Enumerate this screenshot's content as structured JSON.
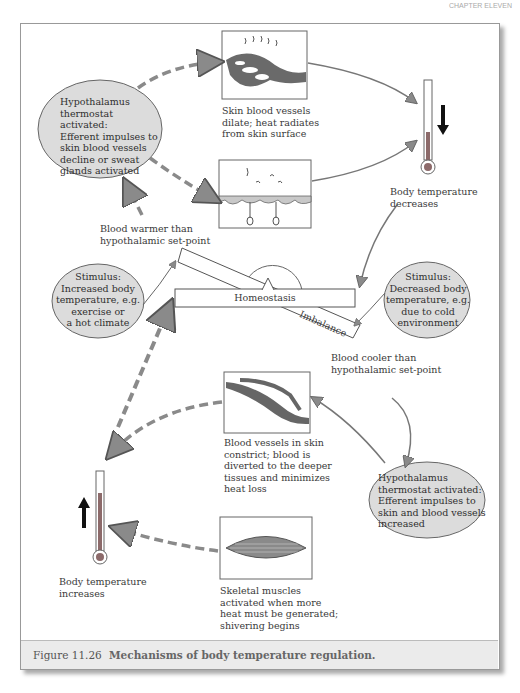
{
  "header": {
    "corner_text": "CHAPTER ELEVEN"
  },
  "diagram": {
    "hypothalamus_top": "Hypothalamus thermostat activated: Efferent impulses to skin blood vessels decline or sweat glands activated",
    "hypothalamus_top_lines": [
      "Hypothalamus",
      "thermostat activated:",
      "Efferent impulses to",
      "skin blood vessels",
      "decline or sweat",
      "glands activated"
    ],
    "skin_dilate_lines": [
      "Skin blood vessels",
      "dilate; heat radiates",
      "from skin surface"
    ],
    "temp_decreases_lines": [
      "Body temperature",
      "decreases"
    ],
    "blood_warmer_lines": [
      "Blood warmer than",
      "hypothalamic set-point"
    ],
    "stimulus_hot_lines": [
      "Stimulus:",
      "Increased body",
      "temperature, e.g.",
      "exercise or",
      "a hot climate"
    ],
    "homeostasis": "Homeostasis",
    "imbalance": "Imbalance",
    "stimulus_cold_lines": [
      "Stimulus:",
      "Decreased body",
      "temperature, e.g.",
      "due to cold",
      "environment"
    ],
    "blood_cooler_lines": [
      "Blood cooler than",
      "hypothalamic set-point"
    ],
    "constrict_lines": [
      "Blood vessels in skin",
      "constrict; blood is",
      "diverted to the deeper",
      "tissues and minimizes",
      "heat loss"
    ],
    "hypothalamus_bottom_lines": [
      "Hypothalamus",
      "thermostat activated:",
      "Efferent impulses to",
      "skin and blood vessels",
      "increased"
    ],
    "temp_increases_lines": [
      "Body temperature",
      "increases"
    ],
    "muscles_lines": [
      "Skeletal muscles",
      "activated when more",
      "heat must be generated;",
      "shivering begins"
    ]
  },
  "caption": {
    "number": "Figure 11.26",
    "text": "Mechanisms of body temperature regulation."
  },
  "colors": {
    "ellipse_fill": "#dcdcdc",
    "arrow_fill": "#8a8a8a",
    "vessel": "#666666",
    "mercury": "#8c6a6a"
  }
}
